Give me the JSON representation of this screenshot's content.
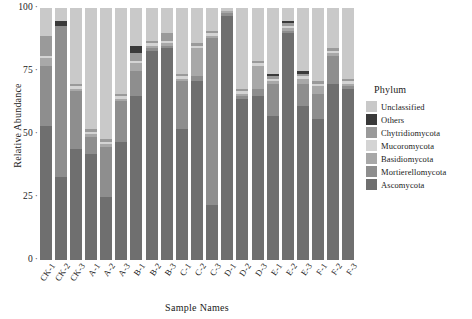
{
  "chart_data": {
    "type": "bar",
    "subtype": "stacked-percent",
    "title": "",
    "xlabel": "Sample Names",
    "ylabel": "Relative Abundance",
    "ylim": [
      0,
      100
    ],
    "yticks": [
      0,
      25,
      50,
      75,
      100
    ],
    "ytick_labels": [
      "0",
      "25",
      "50",
      "75",
      "100"
    ],
    "grid": false,
    "legend_title": "Phylum",
    "legend_position": "right",
    "categories": [
      "CK-1",
      "CK-2",
      "CK-3",
      "A-1",
      "A-2",
      "A-3",
      "B-1",
      "B-2",
      "B-3",
      "C-1",
      "C-2",
      "C-3",
      "D-1",
      "D-2",
      "D-3",
      "E-1",
      "E-2",
      "E-3",
      "F-1",
      "F-2",
      "F-3"
    ],
    "series": [
      {
        "name": "Ascomycota",
        "color": "#6f6f6f",
        "values": [
          53,
          33,
          44,
          42,
          25,
          47,
          65,
          83,
          84,
          52,
          71,
          22,
          97,
          64,
          65,
          57,
          90,
          61,
          56,
          70,
          68
        ]
      },
      {
        "name": "Mortierellomycota",
        "color": "#8e8e8e",
        "values": [
          24,
          60,
          23,
          7,
          20,
          16,
          10,
          1,
          1,
          19,
          2,
          66,
          1,
          1,
          3,
          13,
          1,
          9,
          10,
          11,
          1
        ]
      },
      {
        "name": "Basidiomycota",
        "color": "#a8a8a8",
        "values": [
          3,
          0,
          1,
          1,
          1,
          1,
          3,
          1,
          1,
          1,
          11,
          1,
          1,
          1,
          9,
          1,
          1,
          2,
          3,
          1,
          1
        ]
      },
      {
        "name": "Mucoromycota",
        "color": "#d4d4d4",
        "values": [
          1,
          0,
          1,
          1,
          1,
          1,
          1,
          1,
          1,
          1,
          1,
          1,
          0,
          1,
          1,
          1,
          1,
          1,
          1,
          1,
          1
        ]
      },
      {
        "name": "Chytridiomycota",
        "color": "#9a9a9a",
        "values": [
          8,
          0,
          1,
          1,
          1,
          1,
          3,
          1,
          3,
          1,
          1,
          1,
          0,
          1,
          1,
          1,
          1,
          1,
          1,
          1,
          1
        ]
      },
      {
        "name": "Others",
        "color": "#3a3a3a",
        "values": [
          0,
          2,
          0,
          0,
          0,
          0,
          3,
          0,
          0,
          0,
          0,
          0,
          0,
          0,
          0,
          1,
          1,
          1,
          0,
          0,
          0
        ]
      },
      {
        "name": "Unclassified",
        "color": "#c9c9c9",
        "values": [
          11,
          5,
          30,
          48,
          52,
          34,
          15,
          13,
          10,
          26,
          14,
          9,
          1,
          32,
          21,
          26,
          5,
          25,
          29,
          16,
          28
        ]
      }
    ],
    "legend_entries": [
      {
        "label": "Unclassified",
        "color": "#c9c9c9"
      },
      {
        "label": "Others",
        "color": "#3a3a3a"
      },
      {
        "label": "Chytridiomycota",
        "color": "#9a9a9a"
      },
      {
        "label": "Mucoromycota",
        "color": "#d4d4d4"
      },
      {
        "label": "Basidiomycota",
        "color": "#a8a8a8"
      },
      {
        "label": "Mortierellomycota",
        "color": "#8e8e8e"
      },
      {
        "label": "Ascomycota",
        "color": "#6f6f6f"
      }
    ]
  }
}
